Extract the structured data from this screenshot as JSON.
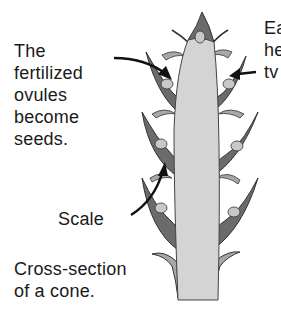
{
  "labels": {
    "seeds": {
      "lines": [
        "The",
        "fertilized",
        "ovules",
        "become",
        "seeds."
      ]
    },
    "scale": "Scale",
    "caption": {
      "lines": [
        "Cross-section",
        "of a cone."
      ]
    },
    "right_cutoff": {
      "lines": [
        "Ea",
        "he",
        "tv"
      ]
    }
  },
  "colors": {
    "axis_fill": "#d4d4d4",
    "scale_fill": "#6b6b6b",
    "scale_light": "#a8a8a8",
    "seed_fill": "#c8c8c8",
    "outline": "#333333",
    "arrow": "#111111",
    "text": "#1a1a1a"
  }
}
